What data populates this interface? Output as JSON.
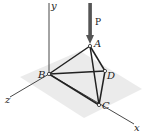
{
  "figure": {
    "type": "3d-truss",
    "axes": {
      "x_label": "x",
      "y_label": "y",
      "z_label": "z"
    },
    "load": {
      "label": "P",
      "applied_at": "A",
      "direction": "down"
    },
    "joints": [
      {
        "id": "A",
        "label": "A"
      },
      {
        "id": "B",
        "label": "B"
      },
      {
        "id": "C",
        "label": "C"
      },
      {
        "id": "D",
        "label": "D"
      }
    ],
    "members": [
      [
        "A",
        "B"
      ],
      [
        "A",
        "C"
      ],
      [
        "A",
        "D"
      ],
      [
        "B",
        "C"
      ],
      [
        "B",
        "D"
      ],
      [
        "C",
        "D"
      ]
    ],
    "colors": {
      "plane": "#e6e6e6",
      "arrow": "#555555",
      "lines": "#222222"
    }
  }
}
